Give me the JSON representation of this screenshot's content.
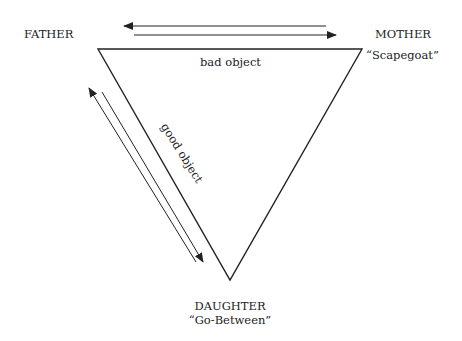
{
  "diagram": {
    "nodes": {
      "father": {
        "label": "FATHER"
      },
      "mother": {
        "label": "MOTHER",
        "role": "“Scapegoat”"
      },
      "daughter": {
        "label": "DAUGHTER",
        "role": "“Go-Between”"
      }
    },
    "edges": {
      "father_mother": {
        "label": "bad object"
      },
      "father_daughter": {
        "label": "good object"
      }
    },
    "colors": {
      "line": "#222222",
      "background": "#ffffff"
    }
  }
}
